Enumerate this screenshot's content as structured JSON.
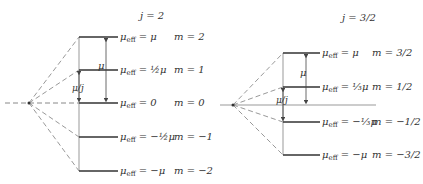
{
  "diagrams": [
    {
      "title": "j = 2",
      "levels": [
        {
          "mu_eff": "= μ",
          "m": "m = 2"
        },
        {
          "mu_eff": "= ½μ",
          "m": "m = 1"
        },
        {
          "mu_eff": "= 0",
          "m": "m = 0"
        },
        {
          "mu_eff": "= −½μ",
          "m": "m = −1"
        },
        {
          "mu_eff": "= −μ",
          "m": "m = −2"
        }
      ],
      "spacing_label": "μ/j",
      "arrow_label": "μ"
    },
    {
      "title": "j = 3/2",
      "levels": [
        {
          "mu_eff": "= μ",
          "m": "m = 3/2"
        },
        {
          "mu_eff": "= ⅓μ",
          "m": "m = 1/2"
        },
        {
          "mu_eff": "= −⅓μ",
          "m": "m = −1/2"
        },
        {
          "mu_eff": "= −μ",
          "m": "m = −3/2"
        }
      ],
      "spacing_label": "μ/j",
      "arrow_label": "μ"
    }
  ],
  "symbols": {
    "mu": "μ",
    "eff": "eff"
  },
  "colors": {
    "line": "#333333",
    "dashed": "#888888"
  }
}
